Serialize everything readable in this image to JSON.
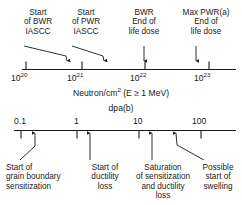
{
  "figure": {
    "background": "#ffffff",
    "line_color": "#1a1a1a",
    "text_color": "#1a1a1a"
  },
  "top_scale": {
    "axis_title_prefix": "Neutron/cm",
    "axis_title_sup": "2",
    "axis_title_suffix": " (E ≥ 1 MeV)",
    "ticks": [
      {
        "mantissa": "10",
        "exponent": "20",
        "x": 26
      },
      {
        "mantissa": "10",
        "exponent": "21",
        "x": 82
      },
      {
        "mantissa": "10",
        "exponent": "22",
        "x": 145
      },
      {
        "mantissa": "10",
        "exponent": "23",
        "x": 209
      }
    ],
    "markers": [
      {
        "x": 67,
        "label_lines": [
          "Start",
          "of BWR",
          "IASCC"
        ]
      },
      {
        "x": 104,
        "label_lines": [
          "Start",
          "of PWR",
          "IASCC"
        ]
      },
      {
        "x": 144,
        "label_lines": [
          "BWR",
          "End of",
          "life dose"
        ]
      },
      {
        "x": 196,
        "label_lines": [
          "Max PWR(a)",
          "End of",
          "life dose"
        ]
      }
    ]
  },
  "bottom_scale": {
    "axis_title": "dpa(b)",
    "ticks": [
      {
        "label": "0.1",
        "x": 21
      },
      {
        "label": "1",
        "x": 77
      },
      {
        "label": "10",
        "x": 139
      },
      {
        "label": "100",
        "x": 201
      }
    ],
    "markers": [
      {
        "x": 35,
        "label_lines": [
          "Start of",
          "grain boundary",
          "sensitization"
        ]
      },
      {
        "x": 90,
        "label_lines": [
          "Start of",
          "ductility",
          "loss"
        ]
      },
      {
        "x": 152,
        "label_lines": [
          "Saturation",
          "of sensitization",
          "and ductility",
          "loss"
        ]
      },
      {
        "x": 176,
        "label_lines": [
          "Possible",
          "start of",
          "swelling"
        ]
      }
    ]
  }
}
